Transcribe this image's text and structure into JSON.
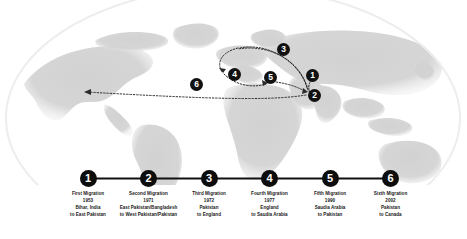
{
  "map": {
    "alt": "world-map-globe",
    "markers": [
      {
        "id": "1",
        "label": "1",
        "x": 313,
        "y": 76
      },
      {
        "id": "2",
        "label": "2",
        "x": 315,
        "y": 96
      },
      {
        "id": "3",
        "label": "3",
        "x": 284,
        "y": 50
      },
      {
        "id": "4",
        "label": "4",
        "x": 235,
        "y": 75
      },
      {
        "id": "5",
        "label": "5",
        "x": 271,
        "y": 78
      },
      {
        "id": "6",
        "label": "6",
        "x": 197,
        "y": 85
      }
    ]
  },
  "timeline": {
    "nodes": [
      {
        "number": "1",
        "title": "First Migration",
        "year": "1953",
        "from": "Bihar, India",
        "to": "to East Pakistan"
      },
      {
        "number": "2",
        "title": "Second Migration",
        "year": "1971",
        "from": "East Pakistan/Bangladesh",
        "to": "to West Pakistan/Pakistan"
      },
      {
        "number": "3",
        "title": "Third Migration",
        "year": "1972",
        "from": "Pakistan",
        "to": "to  England"
      },
      {
        "number": "4",
        "title": "Fourth Migration",
        "year": "1977",
        "from": "England",
        "to": "to Saudia Arabia"
      },
      {
        "number": "5",
        "title": "Fifth Migration",
        "year": "1990",
        "from": "Saudia Arabia",
        "to": "to Pakistan"
      },
      {
        "number": "6",
        "title": "Sixth Migration",
        "year": "2002",
        "from": "Pakistan",
        "to": "to Canada"
      }
    ]
  },
  "colors": {
    "node_fill": "#0d0d0d",
    "node_text": "#ffffff",
    "line": "#111111",
    "land": "#cfcfcf",
    "background": "#ffffff",
    "label_text": "#1a1a1a"
  }
}
